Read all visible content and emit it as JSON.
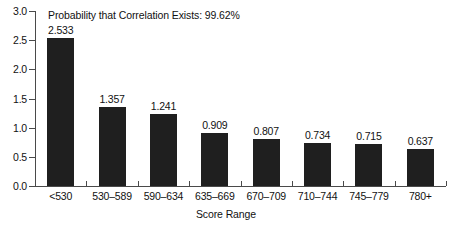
{
  "chart_data": {
    "type": "bar",
    "title": "Probability that Correlation Exists: 99.62%",
    "xlabel": "Score Range",
    "ylabel": "",
    "ylim": [
      0.0,
      3.0
    ],
    "ytick_labels": [
      "0.0",
      "0.5",
      "1.0",
      "1.5",
      "2.0",
      "2.5",
      "3.0"
    ],
    "ytick_values": [
      0.0,
      0.5,
      1.0,
      1.5,
      2.0,
      2.5,
      3.0
    ],
    "grid": false,
    "legend": "none",
    "bar_color": "#1f1f1f",
    "axis_color": "#4a4a4a",
    "background": "#ffffff",
    "categories": [
      "<530",
      "530–589",
      "590–634",
      "635–669",
      "670–709",
      "710–744",
      "745–779",
      "780+"
    ],
    "values": [
      2.533,
      1.357,
      1.241,
      0.909,
      0.807,
      0.734,
      0.715,
      0.637
    ],
    "value_labels": [
      "2.533",
      "1.357",
      "1.241",
      "0.909",
      "0.807",
      "0.734",
      "0.715",
      "0.637"
    ]
  }
}
